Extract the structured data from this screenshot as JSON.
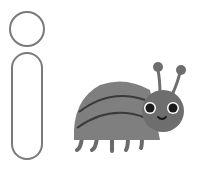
{
  "letter": {
    "glyph": "i",
    "stroke_color": "#7a7a7a",
    "fill_color": "#ffffff"
  },
  "illustration": {
    "subject": "bug",
    "body_color": "#7f7f7f",
    "head_color": "#6e6e6e",
    "stripe_color": "#3a3a3a",
    "leg_color": "#6a6a6a",
    "eye_color": "#1a1a1a",
    "eye_highlight": "#ffffff"
  }
}
